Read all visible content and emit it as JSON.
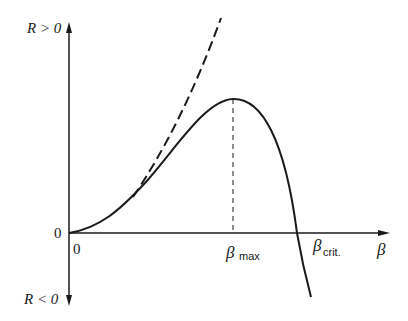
{
  "diagram": {
    "axes": {
      "y_positive_label": "R > 0",
      "y_negative_label": "R < 0",
      "y_origin_label": "0",
      "x_origin_label": "0",
      "x_axis_symbol": "β"
    },
    "markers": {
      "beta_max_symbol": "β",
      "beta_max_subscript": "max",
      "beta_crit_symbol": "β",
      "beta_crit_subscript": "crit."
    },
    "curves": [
      {
        "name": "solid-curve",
        "style": "solid",
        "description": "rises from origin, peaks at β_max, crosses zero at β_crit, goes negative"
      },
      {
        "name": "dashed-asymptote",
        "style": "dashed",
        "description": "tangent-like approximation diverging upward from the solid curve"
      }
    ],
    "colors": {
      "ink": "#1a1a1a",
      "background": "#ffffff"
    }
  }
}
